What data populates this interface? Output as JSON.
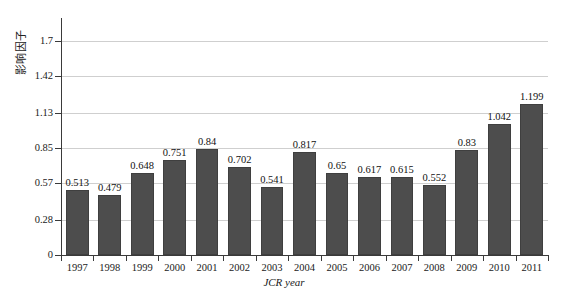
{
  "chart_data": {
    "type": "bar",
    "title": "",
    "xlabel": "JCR year",
    "ylabel": "影响因子",
    "categories": [
      "1997",
      "1998",
      "1999",
      "2000",
      "2001",
      "2002",
      "2003",
      "2004",
      "2005",
      "2006",
      "2007",
      "2008",
      "2009",
      "2010",
      "2011"
    ],
    "values": [
      0.513,
      0.479,
      0.648,
      0.751,
      0.84,
      0.702,
      0.541,
      0.817,
      0.65,
      0.617,
      0.615,
      0.552,
      0.83,
      1.042,
      1.199
    ],
    "value_labels": [
      "0.513",
      "0.479",
      "0.648",
      "0.751",
      "0.84",
      "0.702",
      "0.541",
      "0.817",
      "0.65",
      "0.617",
      "0.615",
      "0.552",
      "0.83",
      "1.042",
      "1.199"
    ],
    "ylim": [
      0,
      1.88
    ],
    "yticks": [
      0,
      0.28,
      0.57,
      0.85,
      1.13,
      1.42,
      1.7
    ],
    "ytick_labels": [
      "0",
      "0.28",
      "0.57",
      "0.85",
      "1.13",
      "1.42",
      "1.7"
    ],
    "grid": true,
    "grid_axis": "y",
    "legend": false,
    "bar_color": "#4d4d4d",
    "gridline_color": "#cfcfcf",
    "axis_color": "#3a3a3a",
    "background_color": "#ffffff"
  },
  "axes": {
    "y_title": "影响因子",
    "x_title_italic_part": "JCR",
    "x_title_rest": " year"
  }
}
